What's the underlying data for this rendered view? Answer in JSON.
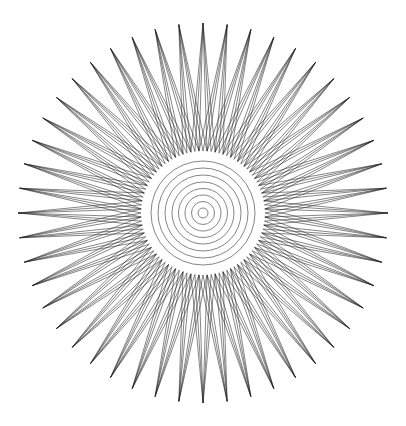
{
  "figure": {
    "type": "geometric-line-art",
    "width": 406,
    "height": 426,
    "background": "#ffffff",
    "center": [
      203,
      213
    ],
    "spikes": {
      "count": 48,
      "tip_radius_x": 185,
      "tip_radius_y": 190,
      "base_radius": 62,
      "lines_per_spike": 6,
      "base_spread_steps": [
        -3,
        -2,
        -1,
        1,
        2,
        3
      ],
      "base_step_fraction": 0.5,
      "stroke": "#222222",
      "stroke_width": 0.55
    },
    "circles": {
      "radii": [
        5,
        11.5,
        18,
        24.5,
        31,
        38,
        45,
        52
      ],
      "stroke": "#777777",
      "stroke_width": 0.9
    }
  }
}
